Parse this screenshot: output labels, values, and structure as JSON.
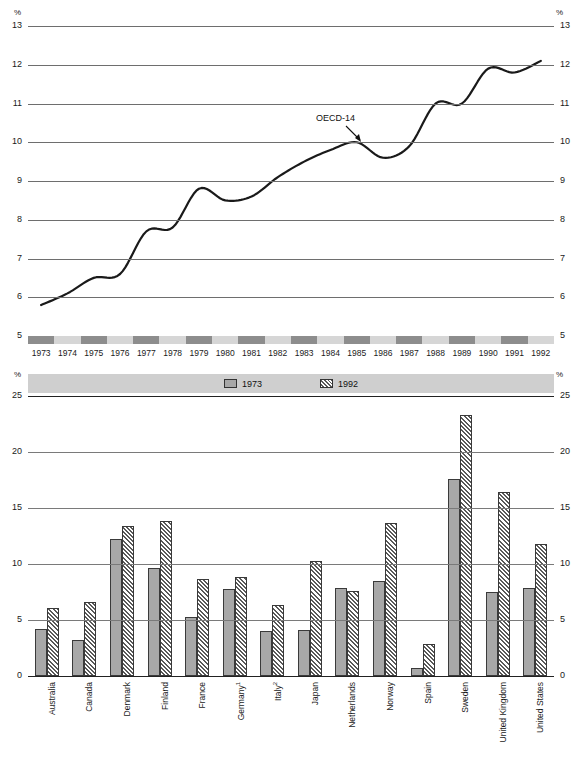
{
  "line_axis": {
    "unit_label": "%",
    "ticks": [
      "13",
      "12",
      "11",
      "10",
      "9",
      "8",
      "7",
      "6",
      "5"
    ]
  },
  "bar_axis": {
    "unit_label": "%",
    "ticks": [
      "25",
      "20",
      "15",
      "10",
      "5",
      "0"
    ]
  },
  "legend": {
    "items": [
      {
        "label": "1973",
        "pattern": "solid"
      },
      {
        "label": "1992",
        "pattern": "hatch"
      }
    ]
  },
  "annotation": {
    "label": "OECD-14"
  },
  "chart_data": [
    {
      "type": "line",
      "title": "",
      "series_name": "OECD-14",
      "xlabel": "",
      "ylabel": "%",
      "ylim": [
        5,
        13
      ],
      "grid": true,
      "annotations": [
        {
          "text": "OECD-14",
          "x": "1985",
          "y": 10.0
        }
      ],
      "x": [
        "1973",
        "1974",
        "1975",
        "1976",
        "1977",
        "1978",
        "1979",
        "1980",
        "1981",
        "1982",
        "1983",
        "1984",
        "1985",
        "1986",
        "1987",
        "1988",
        "1989",
        "1990",
        "1991",
        "1992"
      ],
      "values": [
        5.8,
        6.1,
        6.5,
        6.6,
        7.7,
        7.8,
        8.8,
        8.5,
        8.6,
        9.1,
        9.5,
        9.8,
        10.0,
        9.6,
        9.9,
        11.0,
        11.0,
        11.9,
        11.8,
        12.1
      ]
    },
    {
      "type": "bar",
      "title": "",
      "xlabel": "",
      "ylabel": "%",
      "ylim": [
        0,
        25
      ],
      "grid": true,
      "legend_position": "top-center",
      "categories": [
        "Australia",
        "Canada",
        "Denmark",
        "Finland",
        "France",
        "Germany",
        "Italy",
        "Japan",
        "Netherlands",
        "Norway",
        "Spain",
        "Sweden",
        "United Kingdom",
        "United States"
      ],
      "category_footnotes": {
        "Germany": "1",
        "Italy": "2"
      },
      "series": [
        {
          "name": "1973",
          "values": [
            4.2,
            3.2,
            12.2,
            9.6,
            5.3,
            7.8,
            4.0,
            4.1,
            7.9,
            8.5,
            0.7,
            17.6,
            7.5,
            7.9
          ]
        },
        {
          "name": "1992",
          "values": [
            6.1,
            6.6,
            13.4,
            13.8,
            8.7,
            8.8,
            6.3,
            10.3,
            7.6,
            13.7,
            2.9,
            23.3,
            16.4,
            11.8
          ]
        }
      ]
    }
  ]
}
